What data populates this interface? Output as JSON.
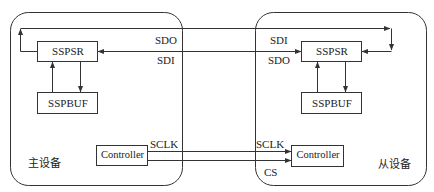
{
  "diagram": {
    "type": "SPI master-slave block diagram",
    "master": {
      "label": "主设备",
      "shift_register": "SSPSR",
      "buffer": "SSPBUF",
      "controller": "Controller"
    },
    "slave": {
      "label": "从设备",
      "shift_register": "SSPSR",
      "buffer": "SSPBUF",
      "controller": "Controller"
    },
    "signals": {
      "master_top": "SDO",
      "master_bottom": "SDI",
      "slave_top": "SDI",
      "slave_bottom": "SDO",
      "master_clk": "SCLK",
      "slave_clk": "SCLK",
      "slave_cs": "CS"
    },
    "colors": {
      "line": "#333333",
      "background": "#ffffff"
    }
  }
}
